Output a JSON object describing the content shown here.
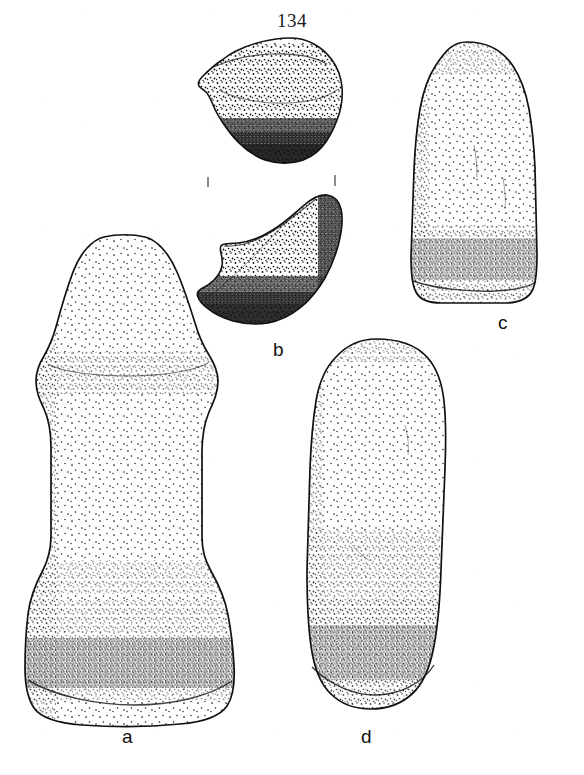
{
  "page": {
    "number": "134",
    "background_color": "#ffffff",
    "ink_color": "#111111",
    "width": 584,
    "height": 775,
    "medium": "stipple line drawing"
  },
  "plate": {
    "caption_labels": [
      "a",
      "b",
      "c",
      "d"
    ],
    "figures": [
      {
        "id": "a",
        "label": "a",
        "name": "flanged-stone-pestle",
        "description": "Tall stone pestle with knobbed pointed top, constricted neck, straight shaft and flaring rectangular base with heavily worn dark grinding surface",
        "label_x": 122,
        "label_y": 727
      },
      {
        "id": "b",
        "label": "b",
        "name": "stone-vessel-fragments",
        "description": "Two conjoining rim fragments of a ground stone object shown one above the other with break tick marks between",
        "label_x": 273,
        "label_y": 340
      },
      {
        "id": "c",
        "label": "c",
        "name": "stone-celt",
        "description": "Rounded-top stone celt or adze with flat base and dark worn bit edge",
        "label_x": 498,
        "label_y": 313
      },
      {
        "id": "d",
        "label": "d",
        "name": "elongated-stone-mano",
        "description": "Long cylindrical stone mano or pestle with rounded top, slight taper and dark worn rounded base",
        "label_x": 361,
        "label_y": 727
      }
    ],
    "break_marks": [
      {
        "x": 208,
        "y": 182
      },
      {
        "x": 335,
        "y": 180
      }
    ]
  }
}
